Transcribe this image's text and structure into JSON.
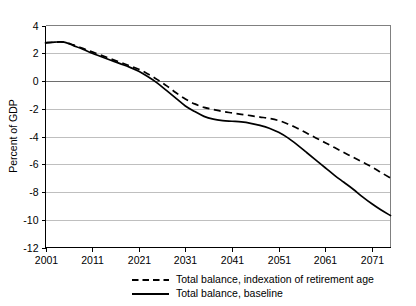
{
  "chart_data": {
    "type": "line",
    "title": "",
    "xlabel": "",
    "ylabel": "Percent of GDP",
    "xlim": [
      2001,
      2075
    ],
    "ylim": [
      -12,
      4
    ],
    "grid": true,
    "legend_position": "bottom",
    "x_ticks": [
      "2001",
      "2011",
      "2021",
      "2031",
      "2041",
      "2051",
      "2061",
      "2071"
    ],
    "x_tick_values": [
      2001,
      2011,
      2021,
      2031,
      2041,
      2051,
      2061,
      2071
    ],
    "y_ticks": [
      "4",
      "2",
      "0",
      "-2",
      "-4",
      "-6",
      "-8",
      "-10",
      "-12"
    ],
    "y_tick_values": [
      4,
      2,
      0,
      -2,
      -4,
      -6,
      -8,
      -10,
      -12
    ],
    "series": [
      {
        "name": "Total balance, indexation of retirement age",
        "style": "dashed",
        "color": "#000000",
        "x": [
          2001,
          2003,
          2005,
          2007,
          2009,
          2011,
          2013,
          2015,
          2017,
          2019,
          2021,
          2023,
          2025,
          2027,
          2029,
          2031,
          2033,
          2035,
          2037,
          2039,
          2041,
          2043,
          2045,
          2047,
          2049,
          2051,
          2053,
          2055,
          2057,
          2059,
          2061,
          2063,
          2065,
          2067,
          2069,
          2071,
          2073,
          2075
        ],
        "values": [
          2.75,
          2.8,
          2.8,
          2.6,
          2.35,
          2.1,
          1.85,
          1.6,
          1.35,
          1.1,
          0.85,
          0.5,
          0.1,
          -0.35,
          -0.85,
          -1.3,
          -1.65,
          -1.9,
          -2.05,
          -2.2,
          -2.3,
          -2.4,
          -2.5,
          -2.6,
          -2.7,
          -2.85,
          -3.1,
          -3.4,
          -3.75,
          -4.1,
          -4.45,
          -4.8,
          -5.15,
          -5.5,
          -5.85,
          -6.2,
          -6.6,
          -7.0
        ]
      },
      {
        "name": "Total balance, baseline",
        "style": "solid",
        "color": "#000000",
        "x": [
          2001,
          2003,
          2005,
          2007,
          2009,
          2011,
          2013,
          2015,
          2017,
          2019,
          2021,
          2023,
          2025,
          2027,
          2029,
          2031,
          2033,
          2035,
          2037,
          2039,
          2041,
          2043,
          2045,
          2047,
          2049,
          2051,
          2053,
          2055,
          2057,
          2059,
          2061,
          2063,
          2065,
          2067,
          2069,
          2071,
          2073,
          2075
        ],
        "values": [
          2.75,
          2.8,
          2.8,
          2.55,
          2.3,
          2.0,
          1.75,
          1.5,
          1.25,
          1.0,
          0.7,
          0.3,
          -0.15,
          -0.7,
          -1.25,
          -1.8,
          -2.2,
          -2.55,
          -2.75,
          -2.85,
          -2.9,
          -2.95,
          -3.05,
          -3.2,
          -3.4,
          -3.7,
          -4.1,
          -4.6,
          -5.15,
          -5.7,
          -6.25,
          -6.8,
          -7.3,
          -7.8,
          -8.35,
          -8.85,
          -9.3,
          -9.7
        ]
      }
    ],
    "legend": [
      {
        "label": "Total balance, indexation of retirement age",
        "style": "dashed"
      },
      {
        "label": "Total balance, baseline",
        "style": "solid"
      }
    ]
  }
}
